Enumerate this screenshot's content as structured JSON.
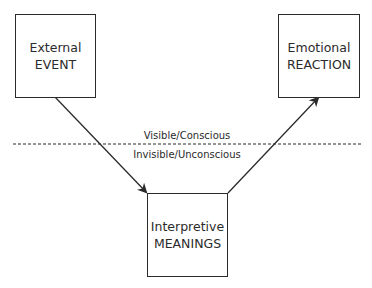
{
  "diagram": {
    "nodes": [
      {
        "id": "external-event",
        "line1": "External",
        "line2": "EVENT"
      },
      {
        "id": "emotional-reaction",
        "line1": "Emotional",
        "line2": "REACTION"
      },
      {
        "id": "interpretive-meanings",
        "line1": "Interpretive",
        "line2": "MEANINGS"
      }
    ],
    "edges": [
      {
        "from": "external-event",
        "to": "interpretive-meanings"
      },
      {
        "from": "interpretive-meanings",
        "to": "emotional-reaction"
      }
    ],
    "divider": {
      "above_label": "Visible/Conscious",
      "below_label": "Invisible/Unconscious"
    }
  }
}
